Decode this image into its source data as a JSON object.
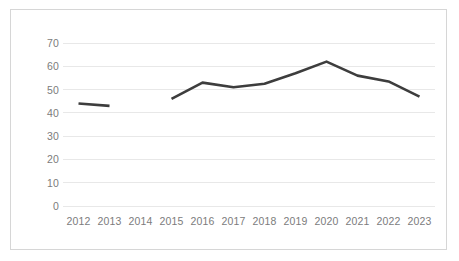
{
  "chart_data": {
    "type": "line",
    "title": "",
    "subtitle": "",
    "xlabel": "",
    "ylabel": "",
    "categories": [
      "2012",
      "2013",
      "2014",
      "2015",
      "2016",
      "2017",
      "2018",
      "2019",
      "2020",
      "2021",
      "2022",
      "2023"
    ],
    "values": [
      44,
      43,
      null,
      46,
      53,
      51,
      52.5,
      57,
      62,
      56,
      53.5,
      47
    ],
    "series": [
      {
        "name": "",
        "values": [
          44,
          43,
          null,
          46,
          53,
          51,
          52.5,
          57,
          62,
          56,
          53.5,
          47
        ]
      }
    ],
    "gap_categories": [
      "2014"
    ],
    "ylim": [
      0,
      70
    ],
    "y_ticks": [
      0,
      10,
      20,
      30,
      40,
      50,
      60,
      70
    ],
    "y_tick_labels": [
      "0",
      "10",
      "20",
      "30",
      "40",
      "50",
      "60",
      "70"
    ],
    "x_tick_labels": [
      "2012",
      "2013",
      "2014",
      "2015",
      "2016",
      "2017",
      "2018",
      "2019",
      "2020",
      "2021",
      "2022",
      "2023"
    ],
    "grid": "horizontal",
    "legend": "none",
    "annotations": [],
    "colors": {
      "line": "#3d3d3d",
      "gridline": "#e8e8e8",
      "tick_label": "#7c7c7c",
      "frame_border": "#d6d6d6",
      "plot_background": "#ffffff"
    },
    "line_width": 2.6
  }
}
